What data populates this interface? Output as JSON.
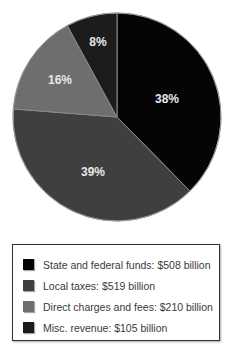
{
  "chart_data": {
    "type": "pie",
    "title": "",
    "categories": [
      "State and federal funds",
      "Local taxes",
      "Direct charges and fees",
      "Misc. revenue"
    ],
    "values": [
      508,
      519,
      210,
      105
    ],
    "units": "billion USD",
    "slice_labels": [
      "38%",
      "39%",
      "16%",
      "8%"
    ],
    "slice_percentages": [
      38,
      39,
      16,
      8
    ],
    "colors": [
      "#050505",
      "#3f3f3f",
      "#6e6e6e",
      "#1c1c1c"
    ],
    "start_angle": "12 o'clock, clockwise",
    "legend_position": "bottom",
    "note": "Printed percentage labels sum to 101% due to rounding; slices drawn from labels to match the figure."
  },
  "legend": {
    "items": [
      {
        "label": "State and federal funds: $508 billion",
        "color": "#050505"
      },
      {
        "label": "Local taxes: $519 billion",
        "color": "#3f3f3f"
      },
      {
        "label": "Direct charges and fees: $210 billion",
        "color": "#6e6e6e"
      },
      {
        "label": "Misc. revenue: $105 billion",
        "color": "#1c1c1c"
      }
    ]
  },
  "labels": {
    "s0": "38%",
    "s1": "39%",
    "s2": "16%",
    "s3": "8%"
  }
}
